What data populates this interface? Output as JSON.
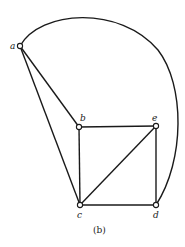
{
  "diagram": {
    "type": "graph",
    "caption": "(b)",
    "nodes": [
      {
        "id": "a",
        "label": "a",
        "x": 20,
        "y": 46
      },
      {
        "id": "b",
        "label": "b",
        "x": 79,
        "y": 127
      },
      {
        "id": "e",
        "label": "e",
        "x": 156,
        "y": 126
      },
      {
        "id": "c",
        "label": "c",
        "x": 80,
        "y": 205
      },
      {
        "id": "d",
        "label": "d",
        "x": 156,
        "y": 205
      }
    ],
    "edges": [
      {
        "from": "a",
        "to": "b",
        "kind": "straight"
      },
      {
        "from": "a",
        "to": "c",
        "kind": "straight"
      },
      {
        "from": "a",
        "to": "d",
        "kind": "curved"
      },
      {
        "from": "b",
        "to": "e",
        "kind": "straight"
      },
      {
        "from": "b",
        "to": "c",
        "kind": "straight"
      },
      {
        "from": "e",
        "to": "c",
        "kind": "straight"
      },
      {
        "from": "e",
        "to": "d",
        "kind": "straight"
      },
      {
        "from": "c",
        "to": "d",
        "kind": "straight"
      }
    ],
    "colors": {
      "stroke": "#1a1a1a",
      "background": "#ffffff"
    }
  }
}
